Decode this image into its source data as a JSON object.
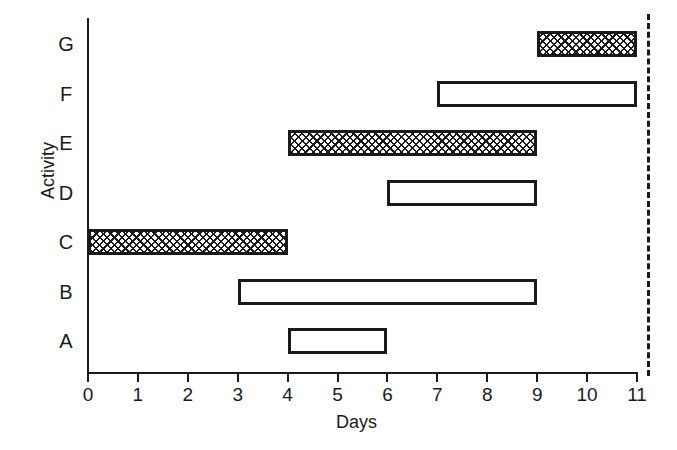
{
  "chart_data": {
    "type": "bar",
    "orientation": "horizontal",
    "subtype": "gantt",
    "title": "",
    "xlabel": "Days",
    "ylabel": "Activity",
    "xlim": [
      0,
      11
    ],
    "xticks": [
      0,
      1,
      2,
      3,
      4,
      5,
      6,
      7,
      8,
      9,
      10,
      11
    ],
    "xtick_labels": [
      "0",
      "1",
      "2",
      "3",
      "4",
      "5",
      "6",
      "7",
      "8",
      "9",
      "10",
      "11"
    ],
    "categories": [
      "A",
      "B",
      "C",
      "D",
      "E",
      "F",
      "G"
    ],
    "grid": false,
    "legend": false,
    "bar_edge_color": "#1a1a1a",
    "bar_fill_color": "#ffffff",
    "bar_hatch_color": "#1a1a1a",
    "tasks": [
      {
        "activity": "A",
        "start": 4,
        "end": 6,
        "duration": 2,
        "fill": "open",
        "row": 0
      },
      {
        "activity": "B",
        "start": 3,
        "end": 9,
        "duration": 6,
        "fill": "open",
        "row": 1
      },
      {
        "activity": "C",
        "start": 0,
        "end": 4,
        "duration": 4,
        "fill": "hatched",
        "row": 2
      },
      {
        "activity": "D",
        "start": 6,
        "end": 9,
        "duration": 3,
        "fill": "open",
        "row": 3
      },
      {
        "activity": "E",
        "start": 4,
        "end": 9,
        "duration": 5,
        "fill": "hatched",
        "row": 4
      },
      {
        "activity": "F",
        "start": 7,
        "end": 11,
        "duration": 4,
        "fill": "open",
        "row": 5
      },
      {
        "activity": "G",
        "start": 9,
        "end": 11,
        "duration": 2,
        "fill": "hatched",
        "row": 6
      }
    ],
    "annotations": [
      {
        "name": "project-deadline",
        "type": "vline",
        "x": 11.2,
        "style": "dashed",
        "color": "#1a1a1a",
        "label": ""
      }
    ]
  }
}
